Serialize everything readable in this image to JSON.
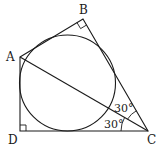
{
  "diagram": {
    "type": "geometry",
    "vertices": {
      "A": {
        "label": "A",
        "x": 20,
        "y": 57
      },
      "B": {
        "label": "B",
        "x": 83,
        "y": 19
      },
      "C": {
        "label": "C",
        "x": 148,
        "y": 131
      },
      "D": {
        "label": "D",
        "x": 20,
        "y": 131
      }
    },
    "segments": [
      "AB",
      "BC",
      "CD",
      "DA",
      "AC"
    ],
    "right_angles": [
      "B",
      "D"
    ],
    "inscribed_circle": {
      "cx": 67.5,
      "cy": 83,
      "r": 48
    },
    "angles": [
      {
        "label": "30°",
        "between": "BC-AC"
      },
      {
        "label": "30°",
        "between": "AC-DC"
      }
    ]
  }
}
